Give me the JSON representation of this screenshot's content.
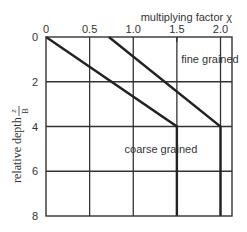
{
  "chart_data": {
    "type": "line",
    "title": "",
    "xlabel": "multiplying factor χ",
    "ylabel": "relative depth",
    "ylabel_fraction": {
      "numerator": "z",
      "denominator": "B"
    },
    "x_ticks": [
      "0",
      "0.5",
      "1.0",
      "1.5",
      "2.0"
    ],
    "x_tick_values": [
      0,
      0.5,
      1.0,
      1.5,
      2.0
    ],
    "y_ticks": [
      "0",
      "2",
      "4",
      "6",
      "8"
    ],
    "y_tick_values": [
      0,
      2,
      4,
      6,
      8
    ],
    "xlim": [
      0,
      2.15
    ],
    "ylim": [
      8,
      0
    ],
    "x_axis_position": "top",
    "y_inverted": true,
    "grid": true,
    "series": [
      {
        "name": "coarse grained",
        "x": [
          0,
          1.5,
          1.5
        ],
        "y": [
          0,
          4,
          8
        ]
      },
      {
        "name": "fine grained",
        "x": [
          0.72,
          2.0,
          2.0
        ],
        "y": [
          0,
          4,
          8
        ]
      }
    ],
    "annotations": [
      {
        "text": "fine grained",
        "x": 1.55,
        "y": 1.0
      },
      {
        "text": "coarse grained",
        "x": 0.9,
        "y": 5.0
      }
    ]
  }
}
